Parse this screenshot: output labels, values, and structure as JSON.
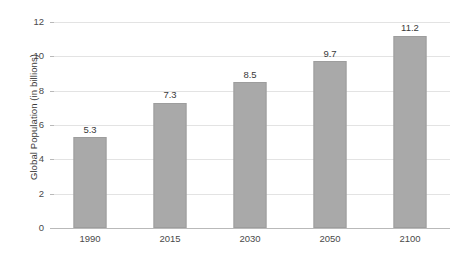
{
  "chart_data": {
    "type": "bar",
    "title": "",
    "subtitle": "",
    "xlabel": "",
    "ylabel": "Global Population (in billions)",
    "categories": [
      "1990",
      "2015",
      "2030",
      "2050",
      "2100"
    ],
    "values": [
      5.3,
      7.3,
      8.5,
      9.7,
      11.2
    ],
    "data_labels": [
      "5.3",
      "7.3",
      "8.5",
      "9.7",
      "11.2"
    ],
    "ylim": [
      0,
      12
    ],
    "ytick_labels": [
      "0",
      "2",
      "4",
      "6",
      "8",
      "10",
      "12"
    ],
    "ytick_values": [
      0,
      2,
      4,
      6,
      8,
      10,
      12
    ],
    "grid": true,
    "grid_axis": "y",
    "legend": null,
    "legend_position": "none",
    "series": [
      {
        "name": "Global Population",
        "values": [
          5.3,
          7.3,
          8.5,
          9.7,
          11.2
        ]
      }
    ],
    "colors": {
      "bar_fill": "#a9a9a9",
      "bar_edge": "#9d9d9d",
      "gridline": "#e3e3e3",
      "axis_line": "#b9b9b9",
      "text": "#3a3a3a",
      "background": "#ffffff"
    }
  }
}
